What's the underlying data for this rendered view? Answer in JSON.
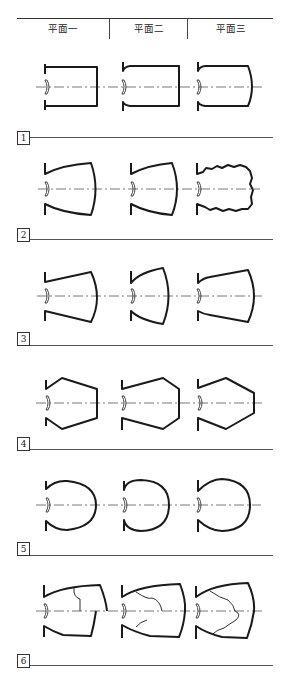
{
  "header": {
    "columns": [
      "平面一",
      "平面二",
      "平面三"
    ]
  },
  "rows": [
    {
      "label": "1",
      "shape": "straight-walled chamber"
    },
    {
      "label": "2",
      "shape": "curved-wall chamber (third variant with irregular wavy wall)"
    },
    {
      "label": "3",
      "shape": "tapered chamber with curved back wall"
    },
    {
      "label": "4",
      "shape": "hexagonal chamber"
    },
    {
      "label": "5",
      "shape": "round / bulb chamber"
    },
    {
      "label": "6",
      "shape": "curved chamber with interior lines"
    }
  ],
  "colors": {
    "line": "#1a1a1a",
    "axis": "#555555",
    "rule": "#555555"
  }
}
